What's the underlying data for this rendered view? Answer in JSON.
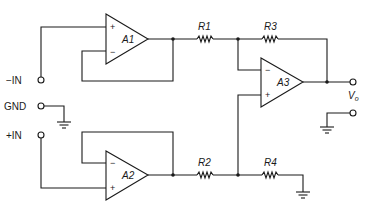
{
  "diagram": {
    "type": "circuit-schematic",
    "amplifiers": [
      {
        "id": "A1",
        "label": "A1",
        "plus": "+",
        "minus": "−"
      },
      {
        "id": "A2",
        "label": "A2",
        "plus": "+",
        "minus": "−"
      },
      {
        "id": "A3",
        "label": "A3",
        "plus": "+",
        "minus": "−"
      }
    ],
    "resistors": [
      {
        "id": "R1",
        "label": "R1"
      },
      {
        "id": "R2",
        "label": "R2"
      },
      {
        "id": "R3",
        "label": "R3"
      },
      {
        "id": "R4",
        "label": "R4"
      }
    ],
    "terminals": {
      "neg_in": "−IN",
      "gnd": "GND",
      "pos_in": "+IN",
      "output": "V",
      "output_sub": "o"
    }
  }
}
